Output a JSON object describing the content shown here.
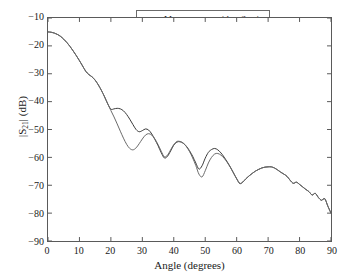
{
  "chart_data": {
    "type": "line",
    "title": "",
    "xlabel": "Angle (degrees)",
    "ylabel": "|S21| (dB)",
    "ylabel_base": "|S",
    "ylabel_sub": "21",
    "ylabel_tail": "| (dB)",
    "xlim": [
      0,
      90
    ],
    "ylim": [
      -90,
      -10
    ],
    "xticks": [
      0,
      10,
      20,
      30,
      40,
      50,
      60,
      70,
      80,
      90
    ],
    "yticks": [
      -10,
      -20,
      -30,
      -40,
      -50,
      -60,
      -70,
      -80,
      -90
    ],
    "xtick_labels": [
      "0",
      "10",
      "20",
      "30",
      "40",
      "50",
      "60",
      "70",
      "80",
      "90"
    ],
    "ytick_labels": [
      "−10",
      "−20",
      "−30",
      "−40",
      "−50",
      "−60",
      "−70",
      "−80",
      "−90"
    ],
    "grid": false,
    "legend_position": "top-right",
    "frame_color": "#5a5a5a",
    "background": "#ffffff",
    "series": [
      {
        "name": "Measurement with reflection",
        "color": "#3a3a3a",
        "width": 1,
        "x": [
          0,
          1,
          2,
          3,
          4,
          5,
          6,
          7,
          8,
          9,
          10,
          11,
          12,
          13,
          14,
          15,
          16,
          17,
          18,
          19,
          20,
          21,
          22,
          23,
          24,
          25,
          26,
          27,
          28,
          29,
          30,
          31,
          32,
          33,
          34,
          35,
          36,
          37,
          38,
          39,
          40,
          41,
          42,
          43,
          44,
          45,
          46,
          47,
          48,
          49,
          50,
          51,
          52,
          53,
          54,
          55,
          56,
          57,
          58,
          59,
          60,
          61,
          62,
          63,
          64,
          65,
          66,
          67,
          68,
          69,
          70,
          71,
          72,
          73,
          74,
          75,
          76,
          77,
          78,
          79,
          80,
          81,
          82,
          83,
          84,
          85,
          86,
          87,
          88,
          89,
          90
        ],
        "y": [
          -15.0,
          -15.1,
          -15.4,
          -15.9,
          -16.6,
          -17.6,
          -18.8,
          -20.2,
          -21.8,
          -23.5,
          -25.3,
          -27.2,
          -29.1,
          -30.3,
          -31.1,
          -32.3,
          -34.0,
          -36.0,
          -38.3,
          -40.8,
          -42.7,
          -42.6,
          -42.4,
          -42.6,
          -43.3,
          -44.6,
          -46.3,
          -48.2,
          -50.0,
          -50.8,
          -50.4,
          -49.8,
          -50.2,
          -51.6,
          -53.6,
          -55.8,
          -58.3,
          -60.2,
          -59.6,
          -57.7,
          -55.6,
          -54.5,
          -54.4,
          -54.9,
          -56.0,
          -57.6,
          -59.6,
          -62.0,
          -64.2,
          -63.0,
          -60.3,
          -58.2,
          -57.2,
          -56.8,
          -57.3,
          -58.4,
          -59.9,
          -61.6,
          -63.5,
          -65.6,
          -67.7,
          -69.4,
          -68.8,
          -67.6,
          -66.6,
          -65.7,
          -64.9,
          -64.3,
          -63.8,
          -63.5,
          -63.4,
          -63.4,
          -63.8,
          -64.5,
          -65.3,
          -66.0,
          -66.8,
          -68.2,
          -69.3,
          -68.9,
          -69.7,
          -70.6,
          -71.5,
          -72.3,
          -73.5,
          -72.9,
          -74.4,
          -75.4,
          -74.8,
          -77.5,
          -80.0
        ]
      },
      {
        "name": "Reference",
        "color": "#6a6a6a",
        "width": 1,
        "x": [
          0,
          1,
          2,
          3,
          4,
          5,
          6,
          7,
          8,
          9,
          10,
          11,
          12,
          13,
          14,
          15,
          16,
          17,
          18,
          19,
          20,
          21,
          22,
          23,
          24,
          25,
          26,
          27,
          28,
          29,
          30,
          31,
          32,
          33,
          34,
          35,
          36,
          37,
          38,
          39,
          40,
          41,
          42,
          43,
          44,
          45,
          46,
          47,
          48,
          49,
          50,
          51,
          52,
          53,
          54,
          55,
          56,
          57,
          58,
          59,
          60,
          61,
          62,
          63,
          64,
          65,
          66,
          67,
          68,
          69,
          70,
          71,
          72,
          73,
          74,
          75,
          76,
          77,
          78,
          79,
          80,
          81,
          82,
          83,
          84,
          85,
          86,
          87,
          88,
          89,
          90
        ],
        "y": [
          -15.0,
          -15.1,
          -15.4,
          -15.9,
          -16.6,
          -17.6,
          -18.8,
          -20.2,
          -21.8,
          -23.5,
          -25.3,
          -27.2,
          -29.1,
          -30.3,
          -31.1,
          -32.3,
          -34.0,
          -36.0,
          -38.3,
          -40.8,
          -43.2,
          -45.5,
          -48.0,
          -50.6,
          -53.1,
          -55.3,
          -56.8,
          -57.3,
          -56.6,
          -55.1,
          -53.4,
          -52.0,
          -51.5,
          -52.0,
          -53.4,
          -55.4,
          -57.8,
          -59.8,
          -59.2,
          -57.3,
          -55.4,
          -54.3,
          -54.3,
          -54.9,
          -56.1,
          -57.9,
          -60.2,
          -62.9,
          -66.0,
          -67.0,
          -64.8,
          -62.0,
          -60.0,
          -58.8,
          -58.6,
          -59.2,
          -60.3,
          -61.8,
          -63.6,
          -65.6,
          -67.6,
          -69.3,
          -68.8,
          -67.6,
          -66.6,
          -65.7,
          -64.9,
          -64.3,
          -63.8,
          -63.5,
          -63.4,
          -63.4,
          -63.8,
          -64.5,
          -65.3,
          -66.0,
          -66.8,
          -68.2,
          -69.3,
          -68.9,
          -69.7,
          -70.6,
          -71.5,
          -72.3,
          -73.5,
          -72.9,
          -74.4,
          -75.4,
          -74.8,
          -77.5,
          -80.0
        ]
      }
    ]
  }
}
